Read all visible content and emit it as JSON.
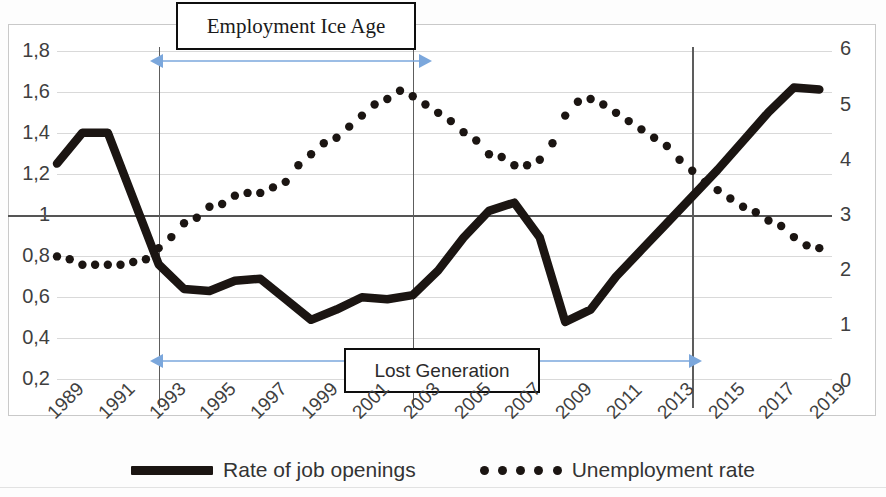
{
  "chart_data": {
    "type": "line",
    "title": "",
    "xlabel": "",
    "ylabel_left": "",
    "ylabel_right": "",
    "grid": true,
    "legend_position": "bottom",
    "x_tick_labels": [
      "1989",
      "1991",
      "1993",
      "1995",
      "1997",
      "1999",
      "2001",
      "2003",
      "2005",
      "2007",
      "2009",
      "2011",
      "2013",
      "2015",
      "2017",
      "2019"
    ],
    "y_left_ticks": [
      "0,2",
      "0,4",
      "0,6",
      "0,8",
      "1",
      "1,2",
      "1,4",
      "1,6",
      "1,8"
    ],
    "y_right_ticks": [
      "0",
      "1",
      "2",
      "3",
      "4",
      "5",
      "6"
    ],
    "ylim_left": [
      0.1,
      1.9
    ],
    "ylim_right": [
      -0.35,
      6.35
    ],
    "xlim": [
      1989,
      2019.5
    ],
    "series": [
      {
        "name": "Rate of job openings",
        "axis": "left",
        "style": "solid-thick",
        "color": "#1b1512",
        "x": [
          1989,
          1990,
          1991,
          1992,
          1993,
          1994,
          1995,
          1996,
          1997,
          1998,
          1999,
          2000,
          2001,
          2002,
          2003,
          2004,
          2005,
          2006,
          2007,
          2008,
          2009,
          2010,
          2011,
          2012,
          2013,
          2014,
          2015,
          2016,
          2017,
          2018,
          2019
        ],
        "values": [
          1.25,
          1.4,
          1.4,
          1.08,
          0.76,
          0.64,
          0.63,
          0.68,
          0.69,
          0.59,
          0.49,
          0.54,
          0.6,
          0.59,
          0.61,
          0.73,
          0.89,
          1.02,
          1.06,
          0.89,
          0.48,
          0.54,
          0.7,
          0.83,
          0.96,
          1.09,
          1.22,
          1.36,
          1.5,
          1.62,
          1.61
        ]
      },
      {
        "name": "Unemployment rate",
        "axis": "right",
        "style": "dotted",
        "color": "#1b1512",
        "x": [
          1989,
          1989.5,
          1990,
          1990.5,
          1991,
          1991.5,
          1992,
          1992.5,
          1993,
          1993.5,
          1994,
          1994.5,
          1995,
          1995.5,
          1996,
          1996.5,
          1997,
          1997.5,
          1998,
          1998.5,
          1999,
          1999.5,
          2000,
          2000.5,
          2001,
          2001.5,
          2002,
          2002.5,
          2003,
          2003.5,
          2004,
          2004.5,
          2005,
          2005.5,
          2006,
          2006.5,
          2007,
          2007.5,
          2008,
          2008.5,
          2009,
          2009.5,
          2010,
          2010.5,
          2011,
          2011.5,
          2012,
          2012.5,
          2013,
          2013.5,
          2014,
          2014.5,
          2015,
          2015.5,
          2016,
          2016.5,
          2017,
          2017.5,
          2018,
          2018.5,
          2019
        ],
        "values_right_axis": [
          2.25,
          2.2,
          2.1,
          2.1,
          2.1,
          2.1,
          2.15,
          2.2,
          2.4,
          2.6,
          2.85,
          2.95,
          3.15,
          3.2,
          3.35,
          3.4,
          3.4,
          3.5,
          3.6,
          3.9,
          4.1,
          4.3,
          4.4,
          4.6,
          4.8,
          5.0,
          5.1,
          5.25,
          5.15,
          5.0,
          4.85,
          4.7,
          4.5,
          4.35,
          4.1,
          4.05,
          3.9,
          3.9,
          4.0,
          4.3,
          4.8,
          5.05,
          5.1,
          5.0,
          4.85,
          4.7,
          4.55,
          4.4,
          4.25,
          4.0,
          3.8,
          3.6,
          3.45,
          3.3,
          3.15,
          3.05,
          2.9,
          2.8,
          2.6,
          2.45,
          2.4
        ]
      }
    ],
    "annotations": [
      {
        "id": "employment-ice-age",
        "label": "Employment Ice Age",
        "span_x": [
          1993,
          2003
        ],
        "arrow": "double",
        "arrow_color": "#7ba7dc"
      },
      {
        "id": "lost-generation",
        "label": "Lost Generation",
        "span_x": [
          1993,
          2014
        ],
        "arrow": "double",
        "arrow_color": "#7ba7dc"
      }
    ],
    "reference_lines_x": [
      1993,
      2003,
      2014
    ]
  },
  "legend": {
    "items": [
      {
        "label": "Rate of job openings",
        "marker": "solid-line-swatch"
      },
      {
        "label": "Unemployment rate",
        "marker": "dotted-line-swatch"
      }
    ]
  },
  "annotation_boxes": {
    "ice_age": "Employment Ice Age",
    "lost_generation": "Lost Generation"
  },
  "colors": {
    "series": "#1b1512",
    "arrow": "#7ba7dc",
    "grid": "#d9d9d9",
    "axis": "#555555",
    "text": "#3f3f3f"
  }
}
